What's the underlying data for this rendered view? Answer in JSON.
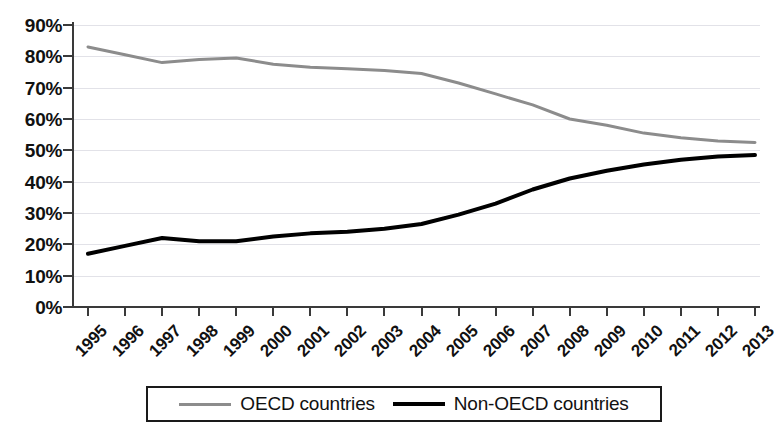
{
  "chart_data": {
    "type": "line",
    "title": "",
    "xlabel": "",
    "ylabel": "",
    "categories": [
      "1995",
      "1996",
      "1997",
      "1998",
      "1999",
      "2000",
      "2001",
      "2002",
      "2003",
      "2004",
      "2005",
      "2006",
      "2007",
      "2008",
      "2009",
      "2010",
      "2011",
      "2012",
      "2013"
    ],
    "ylim": [
      0,
      90
    ],
    "y_tick_step": 10,
    "y_tick_labels": [
      "0%",
      "10%",
      "20%",
      "30%",
      "40%",
      "50%",
      "60%",
      "70%",
      "80%",
      "90%"
    ],
    "y_tick_values": [
      0,
      10,
      20,
      30,
      40,
      50,
      60,
      70,
      80,
      90
    ],
    "grid": true,
    "grid_axis": "y",
    "legend_position": "bottom",
    "value_unit": "%",
    "series": [
      {
        "name": "OECD countries",
        "color": "#8c8c8c",
        "line_width": 3,
        "values": [
          83,
          80.5,
          78,
          79,
          79.5,
          77.5,
          76.5,
          76,
          75.5,
          74.5,
          71.5,
          68,
          64.5,
          60,
          58,
          55.5,
          54,
          53,
          52.5
        ]
      },
      {
        "name": "Non-OECD countries",
        "color": "#000000",
        "line_width": 4,
        "values": [
          17,
          19.5,
          22,
          21,
          21,
          22.5,
          23.5,
          24,
          25,
          26.5,
          29.5,
          33,
          37.5,
          41,
          43.5,
          45.5,
          47,
          48,
          48.5
        ]
      }
    ]
  },
  "legend": {
    "items": [
      {
        "label": "OECD countries"
      },
      {
        "label": "Non-OECD countries"
      }
    ]
  }
}
